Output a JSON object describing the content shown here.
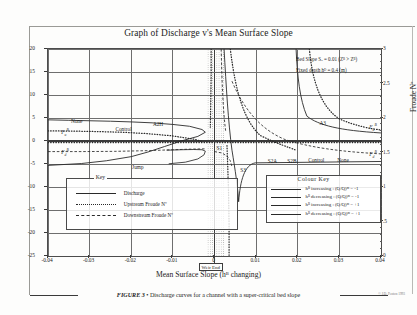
{
  "chart_data": {
    "type": "line",
    "title": "Graph of Discharge v's Mean Surface Slope",
    "xlabel": "Mean Surface Slope  (hᴮ changing)",
    "ylabel": "Discharge (m³/s)",
    "ylabel_right": "Froude Nº",
    "xlim": [
      -0.04,
      0.04
    ],
    "ylim": [
      -25,
      20
    ],
    "ylim_right": [
      0,
      3
    ],
    "grid": true,
    "xticks": [
      "-0.04",
      "-0.03",
      "-0.02",
      "-0.01",
      "0",
      "0.01",
      "0.02",
      "0.03",
      "0.04"
    ],
    "xtick_values": [
      -0.04,
      -0.03,
      -0.02,
      -0.01,
      0,
      0.01,
      0.02,
      0.03,
      0.04
    ],
    "yticks": [
      "20",
      "15",
      "10",
      "5",
      "0",
      "-5",
      "-10",
      "-15",
      "-20",
      "-25"
    ],
    "ytick_values": [
      20,
      15,
      10,
      5,
      0,
      -5,
      -10,
      -15,
      -20,
      -25
    ],
    "yticks_right": [
      "3",
      "2.5",
      "2",
      "1.5",
      "1",
      ".5",
      "0"
    ],
    "ytick_right_values": [
      3,
      2.5,
      2,
      1.5,
      1,
      0.5,
      0
    ],
    "annotations": [
      {
        "text": "Bed Slope  S",
        "sub": "o",
        "text2": "  =   0.01   (Z",
        "sup": "B",
        "text3": " > Z",
        "sup2": "B",
        "text4": ")"
      },
      {
        "text": "Fixed depth h",
        "sup": "D",
        "text2": "   =   0.4 (m)"
      }
    ],
    "note_line1": "Bed Slope  Sₒ  =  0.01   (Zᴮ > Zᴮ)",
    "note_line2": "Fixed depth hᴰ  =  0.4 (m)",
    "curve_labels": [
      {
        "name": "None",
        "x": -0.0345,
        "y": 4.4
      },
      {
        "name": "Control",
        "x": -0.0238,
        "y": 2.6
      },
      {
        "name": "A2H",
        "x": -0.0148,
        "y": 3.6
      },
      {
        "name": "Jump",
        "x": -0.0198,
        "y": -5.6
      },
      {
        "name": "S1",
        "x": 0.0005,
        "y": -1.6
      },
      {
        "name": "S3",
        "x": 0.0062,
        "y": -6.2
      },
      {
        "name": "S2A",
        "x": 0.0128,
        "y": -4.3
      },
      {
        "name": "S2B",
        "x": 0.0175,
        "y": -4.3
      },
      {
        "name": "Control",
        "x": 0.0225,
        "y": -4.1
      },
      {
        "name": "None",
        "x": 0.0295,
        "y": -4.1
      },
      {
        "name": "A3",
        "x": 0.0252,
        "y": 4.0
      }
    ],
    "froude_markers": [
      {
        "label": "F_u^B",
        "x": -0.0368,
        "y": 2.1
      },
      {
        "label": "F_d^B",
        "x": -0.0368,
        "y": -2.2
      },
      {
        "label": "F_u^B",
        "x": 0.0372,
        "y": 3.3
      },
      {
        "label": "F_d^B",
        "x": 0.0372,
        "y": -2.6
      }
    ],
    "weir_end_label": "Weir End",
    "series": [
      {
        "name": "Discharge",
        "style": "solid",
        "color": "#2a2a2a"
      },
      {
        "name": "Upstream Froude Nº",
        "style": "dotted",
        "color": "#2a2a2a"
      },
      {
        "name": "Downstream Froude Nº",
        "style": "dashed",
        "color": "#2a2a2a"
      }
    ]
  },
  "key": {
    "title": "Key",
    "rows": [
      {
        "label": "Discharge",
        "style": "solid"
      },
      {
        "label": "Upstream Froude Nº",
        "style": "dotted"
      },
      {
        "label": "Downstream Froude Nº",
        "style": "dashed"
      }
    ]
  },
  "colour_key": {
    "title": "Colour Key",
    "rows": [
      {
        "cond": "hᴮ increasing",
        "sep": ":",
        "value": "(Q/Q)ᵐ  =  -1"
      },
      {
        "cond": "hᴮ decreasing",
        "sep": ":",
        "value": "(Q/Q)ᵐ  =  -1"
      },
      {
        "cond": "hᴮ increasing",
        "sep": ":",
        "value": "(Q/Q)ᵐ  =  +1"
      },
      {
        "cond": "hᴮ decreasing",
        "sep": ":",
        "value": "(Q/Q)ᵐ  =  +1"
      }
    ]
  },
  "caption": {
    "figure_number": "FIGURE 3",
    "separator": "•",
    "text": "Discharge curves for a channel with a super-critical bed slope",
    "corner_note": "© J.D. Fenton 1993"
  }
}
